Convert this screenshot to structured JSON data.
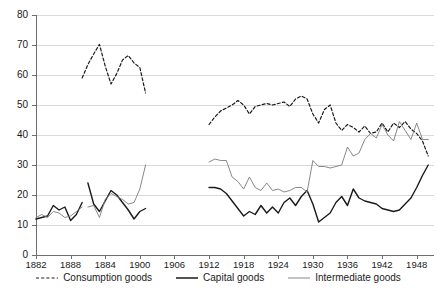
{
  "chart_data": {
    "type": "line",
    "title": "",
    "subtitle": "",
    "xlabel": "",
    "ylabel": "",
    "xlim": [
      1882,
      1951
    ],
    "ylim": [
      0,
      80
    ],
    "grid": true,
    "grid_axis": "y",
    "legend_position": "bottom",
    "y_ticks": [
      0,
      10,
      20,
      30,
      40,
      50,
      60,
      70,
      80
    ],
    "y_tick_labels": [
      "0",
      "10",
      "20",
      "30",
      "40",
      "50",
      "60",
      "70",
      "80"
    ],
    "x_ticks": [
      1882,
      1888,
      1894,
      1900,
      1906,
      1912,
      1918,
      1924,
      1930,
      1936,
      1942,
      1948
    ],
    "x_tick_labels": [
      "1882",
      "1888",
      "1884",
      "1900",
      "1906",
      "1912",
      "1918",
      "1924",
      "1930",
      "1936",
      "1942",
      "1948"
    ],
    "series": [
      {
        "name": "Consumption goods",
        "style": "dashed",
        "color": "#1a1a1a",
        "width": 1.2,
        "segments": [
          {
            "x": [
              1890,
              1891,
              1892,
              1893,
              1894,
              1895,
              1896,
              1897,
              1898,
              1899,
              1900,
              1901
            ],
            "y": [
              59.0,
              63.5,
              67.0,
              70.2,
              63.0,
              57.0,
              60.5,
              65.0,
              66.5,
              64.0,
              62.5,
              54.0
            ]
          },
          {
            "x": [
              1912,
              1913,
              1914,
              1915,
              1916,
              1917,
              1918,
              1919,
              1920,
              1921,
              1922,
              1923,
              1924,
              1925,
              1926,
              1927,
              1928,
              1929,
              1930,
              1931,
              1932,
              1933,
              1934,
              1935,
              1936,
              1937,
              1938,
              1939,
              1940,
              1941,
              1942,
              1943,
              1944,
              1945,
              1946,
              1947,
              1948,
              1949,
              1950
            ],
            "y": [
              43.5,
              46.0,
              48.0,
              49.0,
              50.0,
              51.5,
              50.0,
              47.0,
              49.5,
              50.0,
              50.5,
              50.0,
              50.5,
              51.0,
              49.5,
              52.0,
              53.0,
              52.0,
              47.0,
              44.0,
              48.5,
              50.0,
              44.0,
              41.5,
              43.5,
              42.5,
              41.0,
              43.0,
              40.5,
              41.0,
              44.0,
              41.0,
              44.0,
              42.5,
              44.5,
              42.0,
              40.5,
              38.0,
              33.0
            ]
          }
        ]
      },
      {
        "name": "Capital goods",
        "style": "solid-thick",
        "color": "#1a1a1a",
        "width": 1.4,
        "segments": [
          {
            "x": [
              1882,
              1883,
              1884,
              1885,
              1886,
              1887,
              1888,
              1889,
              1890
            ],
            "y": [
              12.0,
              12.5,
              13.0,
              16.5,
              15.0,
              16.0,
              11.5,
              13.5,
              17.5
            ]
          },
          {
            "x": [
              1891,
              1892,
              1893,
              1894,
              1895,
              1896,
              1897,
              1898,
              1899,
              1900,
              1901
            ],
            "y": [
              24.0,
              17.0,
              14.5,
              18.0,
              21.5,
              20.0,
              17.5,
              15.0,
              12.0,
              14.5,
              15.5
            ]
          },
          {
            "x": [
              1912,
              1913,
              1914,
              1915,
              1916,
              1917,
              1918,
              1919,
              1920,
              1921,
              1922,
              1923,
              1924,
              1925,
              1926,
              1927,
              1928,
              1929,
              1930,
              1931,
              1932,
              1933,
              1934,
              1935,
              1936,
              1937,
              1938,
              1939,
              1940,
              1941,
              1942,
              1943,
              1944,
              1945,
              1946,
              1947,
              1948,
              1949,
              1950
            ],
            "y": [
              22.5,
              22.5,
              22.0,
              20.5,
              18.0,
              15.5,
              13.0,
              14.5,
              13.5,
              16.5,
              14.0,
              16.0,
              14.0,
              17.5,
              19.0,
              16.5,
              19.5,
              21.5,
              17.0,
              11.0,
              12.5,
              14.0,
              17.5,
              19.5,
              16.5,
              22.0,
              19.0,
              18.0,
              17.5,
              17.0,
              15.5,
              15.0,
              14.5,
              15.0,
              17.0,
              19.0,
              22.5,
              26.5,
              30.0
            ]
          }
        ]
      },
      {
        "name": "Intermediate goods",
        "style": "solid-thin",
        "color": "#7a7a7a",
        "width": 0.9,
        "segments": [
          {
            "x": [
              1882,
              1883,
              1884,
              1885,
              1886,
              1887,
              1888,
              1889,
              1890
            ],
            "y": [
              12.5,
              13.5,
              12.5,
              14.5,
              14.0,
              12.5,
              13.0,
              14.5,
              16.0
            ]
          },
          {
            "x": [
              1891,
              1892,
              1893,
              1894,
              1895,
              1896,
              1897,
              1898,
              1899,
              1900,
              1901
            ],
            "y": [
              16.0,
              16.5,
              12.5,
              18.5,
              20.5,
              19.5,
              18.5,
              17.0,
              17.5,
              22.0,
              30.0
            ]
          },
          {
            "x": [
              1912,
              1913,
              1914,
              1915,
              1916,
              1917,
              1918,
              1919,
              1920,
              1921,
              1922,
              1923,
              1924,
              1925,
              1926,
              1927,
              1928,
              1929,
              1930,
              1931,
              1932,
              1933,
              1934,
              1935,
              1936,
              1937,
              1938,
              1939,
              1940,
              1941,
              1942,
              1943,
              1944,
              1945,
              1946,
              1947,
              1948,
              1949,
              1950
            ],
            "y": [
              31.0,
              32.0,
              31.5,
              31.5,
              26.0,
              24.5,
              22.0,
              26.0,
              22.5,
              21.5,
              24.0,
              21.5,
              22.0,
              21.0,
              21.5,
              22.5,
              22.5,
              21.0,
              31.5,
              29.5,
              29.5,
              29.0,
              29.5,
              30.0,
              36.0,
              33.0,
              34.0,
              38.5,
              40.5,
              39.0,
              43.5,
              40.0,
              38.0,
              44.5,
              41.5,
              38.5,
              44.0,
              38.5,
              38.5
            ]
          }
        ]
      }
    ],
    "legend": [
      {
        "label": "Consumption goods",
        "style": "dashed",
        "color": "#1a1a1a"
      },
      {
        "label": "Capital goods",
        "style": "solid-thick",
        "color": "#1a1a1a"
      },
      {
        "label": "Intermediate goods",
        "style": "solid-thin",
        "color": "#7a7a7a"
      }
    ]
  },
  "colors": {
    "background": "#ffffff",
    "grid": "#d9d9d9",
    "axis": "#6e6e6e",
    "text": "#1a1a1a"
  }
}
